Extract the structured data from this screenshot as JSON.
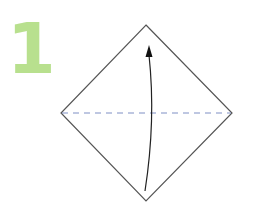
{
  "step": {
    "number": "1",
    "color": "#b8e08e"
  },
  "diagram": {
    "shape": "square-paper-diamond",
    "outline_color": "#555555",
    "fold_line": {
      "type": "valley-fold-dashed",
      "color": "#7f8fc4"
    },
    "arrow": {
      "direction": "up",
      "description": "fold bottom corner up to top corner",
      "color": "#222222"
    }
  }
}
